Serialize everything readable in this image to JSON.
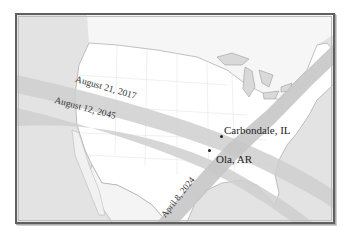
{
  "map": {
    "title": "",
    "colors": {
      "ocean": "#e3e3e3",
      "land": "#ffffff",
      "band": "#cfcfcf",
      "band_overlap": "#b9b9b9",
      "lake": "#d9d9d9",
      "border": "#9a9a9a",
      "frame": "#5f5f5f"
    },
    "eclipse_paths": [
      {
        "label": "August 21, 2017",
        "date": "2017-08-21"
      },
      {
        "label": "August 12, 2045",
        "date": "2045-08-12"
      },
      {
        "label": "April 8, 2024",
        "date": "2024-04-08"
      }
    ],
    "cities": [
      {
        "name": "Carbondale, IL"
      },
      {
        "name": "Ola, AR"
      }
    ]
  }
}
